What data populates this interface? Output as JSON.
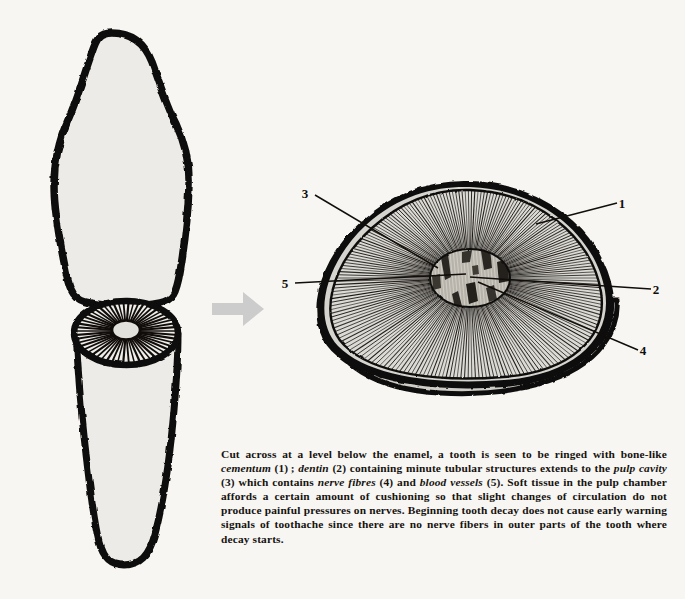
{
  "page": {
    "background_color": "#f7f6f3",
    "ink_color": "#100d0a",
    "enamel_fill": "#ecebe7",
    "dentin_fill": "#d9d7d1",
    "cementum_gap_fill": "#cfcdc7",
    "pulp_fill": "#c9c6bf",
    "arrow_color": "#cccccc"
  },
  "figure": {
    "parts": [
      {
        "name": "tooth-crown",
        "description": "Upper tooth crown, cut away"
      },
      {
        "name": "tooth-root",
        "description": "Lower tooth root showing cut surface with radiating dentin tubules"
      },
      {
        "name": "transition-arrow",
        "description": "Gray arrow pointing right"
      },
      {
        "name": "cross-section",
        "description": "Magnified cross-section of the tooth below the enamel"
      }
    ]
  },
  "labels": [
    {
      "id": "1",
      "text": "1",
      "x": 622,
      "y": 208,
      "structure": "cementum",
      "leader": {
        "x1": 617,
        "y1": 203,
        "x2": 536,
        "y2": 224
      }
    },
    {
      "id": "2",
      "text": "2",
      "x": 656,
      "y": 294,
      "structure": "dentin",
      "leader": {
        "x1": 651,
        "y1": 289,
        "x2": 470,
        "y2": 277
      }
    },
    {
      "id": "3",
      "text": "3",
      "x": 305,
      "y": 198,
      "structure": "pulp cavity",
      "leader": {
        "x1": 315,
        "y1": 195,
        "x2": 438,
        "y2": 268
      }
    },
    {
      "id": "4",
      "text": "4",
      "x": 643,
      "y": 355,
      "structure": "nerve fibres",
      "leader": {
        "x1": 638,
        "y1": 350,
        "x2": 478,
        "y2": 282
      }
    },
    {
      "id": "5",
      "text": "5",
      "x": 285,
      "y": 288,
      "structure": "blood vessels",
      "leader": {
        "x1": 295,
        "y1": 283,
        "x2": 466,
        "y2": 274
      }
    }
  ],
  "caption": {
    "segments": [
      {
        "t": "Cut across at a level below the enamel, a tooth is seen to be ringed with bone-like ",
        "i": false
      },
      {
        "t": "cementum",
        "i": true
      },
      {
        "t": " (1) ; ",
        "i": false
      },
      {
        "t": "dentin",
        "i": true
      },
      {
        "t": " (2) containing minute tubular structures extends to the ",
        "i": false
      },
      {
        "t": "pulp cavity",
        "i": true
      },
      {
        "t": " (3) which contains ",
        "i": false
      },
      {
        "t": "nerve fibres",
        "i": true
      },
      {
        "t": " (4) and ",
        "i": false
      },
      {
        "t": "blood vessels",
        "i": true
      },
      {
        "t": " (5). Soft tissue in the pulp chamber affords a certain amount of cushioning so that slight changes of circulation do not produce painful pressures on nerves. Beginning tooth decay does not cause early warning signals of toothache since there are no nerve fibers in outer parts of the tooth where decay starts.",
        "i": false
      }
    ],
    "plain": "Cut across at a level below the enamel, a tooth is seen to be ringed with bone-like cementum (1); dentin (2) containing minute tubular structures extends to the pulp cavity (3) which contains nerve fibres (4) and blood vessels (5). Soft tissue in the pulp chamber affords a certain amount of cushioning so that slight changes of circulation do not produce painful pressures on nerves. Beginning tooth decay does not cause early warning signals of toothache since there are no nerve fibers in outer parts of the tooth where decay starts."
  }
}
